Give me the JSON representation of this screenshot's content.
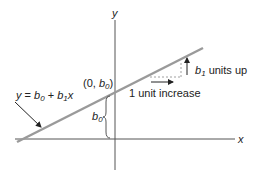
{
  "diagram": {
    "type": "linear-regression-line",
    "axis_labels": {
      "x": "x",
      "y": "y"
    },
    "equation": {
      "y": "y",
      "eq": " = ",
      "b0": "b",
      "b0_sub": "0",
      "plus": " + ",
      "b1": "b",
      "b1_sub": "1",
      "x": "x"
    },
    "intercept_point": {
      "open": "(0, ",
      "b": "b",
      "sub": "0",
      "close": ")"
    },
    "intercept_brace_label": {
      "b": "b",
      "sub": "0"
    },
    "slope_label": {
      "b": "b",
      "sub": "1",
      "text": " units up"
    },
    "run_label": "1 unit increase",
    "colors": {
      "line": "#9a9a9a",
      "axis": "#555555",
      "text": "#222222"
    }
  }
}
